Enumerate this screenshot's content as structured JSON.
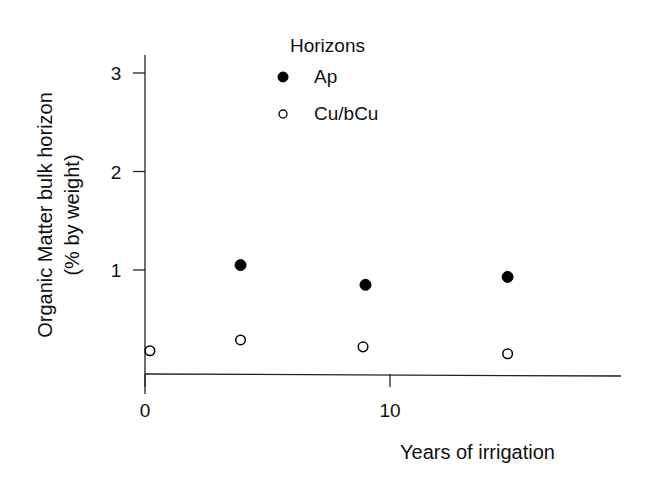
{
  "chart_data": {
    "type": "scatter",
    "title": "",
    "xlabel": "Years of irrigation",
    "ylabel_line1": "Organic Matter bulk horizon",
    "ylabel_line2": "(% by weight)",
    "xlim": [
      0,
      19.5
    ],
    "ylim": [
      -0.04,
      3.2
    ],
    "x_ticks": [
      {
        "value": 0,
        "label": "0"
      },
      {
        "value": 10,
        "label": "10"
      }
    ],
    "y_ticks": [
      {
        "value": 1,
        "label": "1"
      },
      {
        "value": 2,
        "label": "2"
      },
      {
        "value": 3,
        "label": "3"
      }
    ],
    "grid": false,
    "legend": {
      "title": "Horizons",
      "position": "top-center"
    },
    "series": [
      {
        "name": "Ap",
        "marker": "filled-circle",
        "color": "#000000",
        "points": [
          {
            "x": 3.9,
            "y": 1.05
          },
          {
            "x": 9.0,
            "y": 0.85
          },
          {
            "x": 14.8,
            "y": 0.93
          }
        ]
      },
      {
        "name": "Cu/bCu",
        "marker": "open-circle",
        "color": "#000000",
        "points": [
          {
            "x": 0.2,
            "y": 0.18
          },
          {
            "x": 3.9,
            "y": 0.29
          },
          {
            "x": 8.9,
            "y": 0.22
          },
          {
            "x": 14.8,
            "y": 0.15
          }
        ]
      }
    ]
  }
}
